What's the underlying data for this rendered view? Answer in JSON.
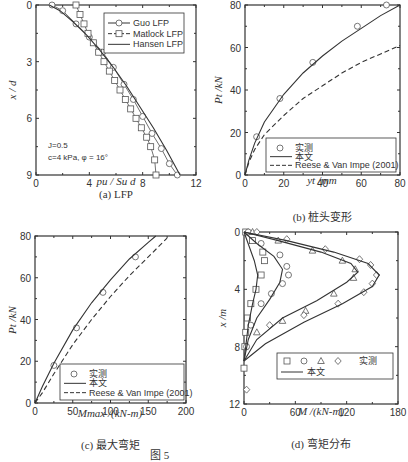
{
  "figure_caption": "图 5",
  "chart_data": [
    {
      "id": "a",
      "type": "line",
      "caption": "(a) LFP",
      "xlabel": "p_u / S_u d",
      "ylabel": "x / d",
      "xlim": [
        0,
        12
      ],
      "ylim": [
        0,
        9
      ],
      "y_inverted": true,
      "xticks": [
        "0",
        "4",
        "8",
        "12"
      ],
      "yticks": [
        "0",
        "3",
        "6",
        "9"
      ],
      "legend": [
        "Guo LFP",
        "Matlock LFP",
        "Hansen LFP"
      ],
      "annotations": [
        "J=0.5",
        "c=4 kPa, φ = 16°"
      ],
      "series": [
        {
          "name": "Guo LFP",
          "marker": "circle",
          "x": [
            1.2,
            2.0,
            3.0,
            4.0,
            5.0,
            5.8,
            6.6,
            7.3,
            8.0,
            8.7,
            9.4,
            10.0,
            10.6
          ],
          "y": [
            0,
            0.3,
            1.0,
            1.7,
            2.5,
            3.3,
            4.2,
            5.0,
            5.9,
            6.8,
            7.6,
            8.4,
            9.0
          ]
        },
        {
          "name": "Matlock LFP",
          "marker": "square",
          "x": [
            3.0,
            3.3,
            3.6,
            3.9,
            4.3,
            4.7,
            5.1,
            5.5,
            5.9,
            6.3,
            6.7,
            7.1,
            7.5,
            7.9,
            8.3,
            8.6,
            8.9,
            9.0
          ],
          "y": [
            0,
            0.5,
            1.0,
            1.5,
            2.0,
            2.5,
            3.0,
            3.5,
            4.0,
            4.5,
            5.0,
            5.5,
            6.0,
            6.5,
            7.0,
            7.5,
            8.2,
            9.0
          ]
        },
        {
          "name": "Hansen LFP",
          "marker": "none",
          "x": [
            1.0,
            1.8,
            2.8,
            3.8,
            4.8,
            5.8,
            6.8,
            7.8,
            8.8,
            9.8,
            10.8
          ],
          "y": [
            0,
            0.3,
            0.9,
            1.6,
            2.4,
            3.3,
            4.3,
            5.4,
            6.5,
            7.7,
            9.0
          ]
        }
      ]
    },
    {
      "id": "b",
      "type": "line",
      "caption": "(b) 桩头变形",
      "xlabel": "y_t /mm",
      "ylabel": "P_t /kN",
      "xlim": [
        0,
        80
      ],
      "ylim": [
        0,
        80
      ],
      "xticks": [
        "0",
        "20",
        "40",
        "60",
        "80"
      ],
      "yticks": [
        "0",
        "20",
        "40",
        "60",
        "80"
      ],
      "legend": [
        "实测",
        "本文",
        "Reese & Van Impe (2001)"
      ],
      "series": [
        {
          "name": "实测",
          "marker": "circle",
          "x": [
            6,
            18,
            35,
            58,
            73
          ],
          "y": [
            18,
            36,
            53,
            70,
            80
          ]
        },
        {
          "name": "本文",
          "marker": "none",
          "x": [
            0,
            2,
            5,
            10,
            20,
            30,
            40,
            50,
            60,
            70,
            80
          ],
          "y": [
            0,
            7,
            15,
            25,
            38,
            48,
            56,
            63,
            69,
            75,
            80
          ]
        },
        {
          "name": "Reese & Van Impe (2001)",
          "marker": "none",
          "dashed": true,
          "x": [
            0,
            2,
            5,
            10,
            20,
            30,
            40,
            50,
            60,
            70,
            80
          ],
          "y": [
            0,
            6,
            12,
            19,
            28,
            36,
            42,
            48,
            53,
            57,
            61
          ]
        }
      ]
    },
    {
      "id": "c",
      "type": "line",
      "caption": "(c) 最大弯矩",
      "xlabel": "M_max /(kN-m)",
      "ylabel": "P_t /kN",
      "xlim": [
        0,
        200
      ],
      "ylim": [
        0,
        80
      ],
      "xticks": [
        "0",
        "50",
        "100",
        "150",
        "200"
      ],
      "yticks": [
        "0",
        "20",
        "40",
        "60",
        "80"
      ],
      "legend": [
        "实测",
        "本文",
        "Reese & Van Impe (2001)"
      ],
      "series": [
        {
          "name": "实测",
          "marker": "circle",
          "x": [
            25,
            55,
            90,
            133
          ],
          "y": [
            18,
            36,
            53,
            70
          ]
        },
        {
          "name": "本文",
          "marker": "none",
          "x": [
            0,
            10,
            25,
            50,
            75,
            100,
            125,
            150,
            160
          ],
          "y": [
            0,
            8,
            19,
            35,
            48,
            59,
            69,
            77,
            80
          ]
        },
        {
          "name": "Reese & Van Impe (2001)",
          "marker": "none",
          "dashed": true,
          "x": [
            0,
            10,
            25,
            50,
            75,
            100,
            125,
            150,
            175
          ],
          "y": [
            0,
            5,
            14,
            28,
            40,
            51,
            61,
            70,
            79
          ]
        }
      ]
    },
    {
      "id": "d",
      "type": "line",
      "caption": "(d) 弯矩分布",
      "xlabel": "M /(kN-m)",
      "ylabel": "x /m",
      "xlim": [
        0,
        180
      ],
      "ylim": [
        0,
        12
      ],
      "y_inverted": true,
      "xticks": [
        "0",
        "60",
        "120",
        "180"
      ],
      "yticks": [
        "0",
        "4",
        "8",
        "12"
      ],
      "legend": [
        "实测 (□ ○ △ ◇)",
        "本文"
      ],
      "series": [
        {
          "name": "实测-□",
          "marker": "square",
          "x": [
            2,
            10,
            22,
            24,
            20,
            14,
            8,
            4,
            2,
            1,
            0
          ],
          "y": [
            0,
            0.6,
            1.4,
            2.0,
            3.0,
            4.0,
            5.0,
            6.0,
            7.0,
            8.0,
            9.5
          ]
        },
        {
          "name": "实测-○",
          "marker": "circle",
          "x": [
            5,
            20,
            42,
            50,
            52,
            45,
            32,
            20,
            8,
            3
          ],
          "y": [
            0,
            0.8,
            1.6,
            2.4,
            3.0,
            3.6,
            4.3,
            5.0,
            6.5,
            8.0
          ]
        },
        {
          "name": "实测-△",
          "marker": "triangle",
          "x": [
            10,
            40,
            80,
            115,
            130,
            128,
            105,
            72,
            45,
            15
          ],
          "y": [
            0,
            0.6,
            1.3,
            2.0,
            2.6,
            3.2,
            4.3,
            5.5,
            6.2,
            7.0
          ]
        },
        {
          "name": "实测-◇",
          "marker": "diamond",
          "x": [
            15,
            50,
            95,
            135,
            148,
            155,
            150,
            140,
            110,
            70,
            30,
            3
          ],
          "y": [
            0,
            0.5,
            1.2,
            1.9,
            2.3,
            3.0,
            3.6,
            4.2,
            5.0,
            5.8,
            6.5,
            11.0
          ]
        },
        {
          "name": "本文-1",
          "marker": "none",
          "x": [
            0,
            6,
            12,
            16,
            14,
            10,
            5,
            2,
            0
          ],
          "y": [
            0,
            1.0,
            2.0,
            3.0,
            4.0,
            5.0,
            6.5,
            8.0,
            9.0
          ]
        },
        {
          "name": "本文-2",
          "marker": "none",
          "x": [
            0,
            15,
            35,
            45,
            42,
            30,
            15,
            5,
            0
          ],
          "y": [
            0,
            0.8,
            1.7,
            2.6,
            3.5,
            4.7,
            6.0,
            7.5,
            9.0
          ]
        },
        {
          "name": "本文-3",
          "marker": "none",
          "x": [
            0,
            40,
            90,
            125,
            133,
            120,
            85,
            45,
            15,
            0
          ],
          "y": [
            0,
            0.6,
            1.4,
            2.2,
            2.8,
            3.5,
            4.8,
            6.0,
            7.5,
            9.0
          ]
        },
        {
          "name": "本文-4",
          "marker": "none",
          "x": [
            0,
            50,
            105,
            145,
            158,
            150,
            115,
            70,
            25,
            0
          ],
          "y": [
            0,
            0.6,
            1.4,
            2.2,
            3.0,
            3.8,
            5.0,
            6.3,
            7.8,
            9.0
          ]
        }
      ]
    }
  ]
}
